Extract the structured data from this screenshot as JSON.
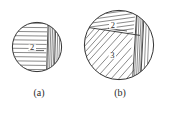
{
  "figure": {
    "title": "",
    "background_color": "#ffffff",
    "line_color": "#3a3a3a",
    "hatch_color": "#555555",
    "panels": [
      {
        "id": "a",
        "caption": "(a)",
        "shape": "circle",
        "center_x": 37,
        "center_y": 47,
        "radius": 25,
        "regions": [
          {
            "label": "2",
            "hatch": "horizontal",
            "label_x": 32,
            "label_y": 50
          },
          {
            "label": "",
            "hatch": "vertical-band",
            "label_x": 0,
            "label_y": 0
          }
        ]
      },
      {
        "id": "b",
        "caption": "(b)",
        "shape": "circle",
        "center_x": 119,
        "center_y": 45,
        "radius": 35,
        "regions": [
          {
            "label": "2",
            "hatch": "horizontal-tilted",
            "label_x": 113,
            "label_y": 28
          },
          {
            "label": "3",
            "hatch": "diagonal",
            "label_x": 112,
            "label_y": 58
          },
          {
            "label": "",
            "hatch": "vertical-band",
            "label_x": 0,
            "label_y": 0
          }
        ]
      }
    ]
  }
}
